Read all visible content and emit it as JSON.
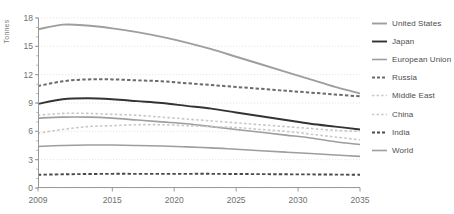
{
  "chart_data": {
    "type": "line",
    "title": "",
    "xlabel": "",
    "ylabel": "Tonnes",
    "xlim": [
      2009,
      2035
    ],
    "ylim": [
      0,
      18
    ],
    "grid": true,
    "legend_position": "right",
    "x_ticks": [
      "2009",
      "2015",
      "2020",
      "2025",
      "2030",
      "2035"
    ],
    "x_tick_values": [
      2009,
      2015,
      2020,
      2025,
      2030,
      2035
    ],
    "y_ticks": [
      "0",
      "3",
      "6",
      "9",
      "12",
      "15",
      "18"
    ],
    "y_tick_values": [
      0,
      3,
      6,
      9,
      12,
      15,
      18
    ],
    "x": [
      2009,
      2011,
      2013,
      2015,
      2017,
      2019,
      2021,
      2023,
      2025,
      2027,
      2029,
      2031,
      2033,
      2035
    ],
    "series": [
      {
        "name": "United States",
        "color": "#9e9e9e",
        "style": "solid",
        "width": 1.9,
        "values": [
          16.8,
          17.3,
          17.2,
          16.9,
          16.5,
          16.0,
          15.4,
          14.7,
          13.9,
          13.1,
          12.3,
          11.5,
          10.7,
          10.0
        ]
      },
      {
        "name": "Japan",
        "color": "#333333",
        "style": "solid",
        "width": 1.9,
        "values": [
          8.9,
          9.4,
          9.5,
          9.4,
          9.2,
          9.0,
          8.7,
          8.4,
          8.0,
          7.6,
          7.2,
          6.8,
          6.5,
          6.2
        ]
      },
      {
        "name": "European Union",
        "color": "#9e9e9e",
        "style": "solid",
        "width": 1.6,
        "values": [
          7.4,
          7.5,
          7.5,
          7.4,
          7.2,
          7.0,
          6.8,
          6.5,
          6.2,
          5.9,
          5.6,
          5.3,
          4.9,
          4.6
        ]
      },
      {
        "name": "Russia",
        "color": "#6b6b6b",
        "style": "dashed",
        "width": 2.0,
        "values": [
          10.8,
          11.3,
          11.5,
          11.5,
          11.4,
          11.3,
          11.1,
          10.9,
          10.7,
          10.5,
          10.3,
          10.1,
          9.9,
          9.7
        ]
      },
      {
        "name": "Middle East",
        "color": "#c8c8c8",
        "style": "dashed",
        "width": 1.6,
        "values": [
          7.7,
          7.9,
          7.9,
          7.8,
          7.7,
          7.5,
          7.3,
          7.1,
          6.9,
          6.7,
          6.5,
          6.3,
          6.1,
          6.0
        ]
      },
      {
        "name": "China",
        "color": "#c8c8c8",
        "style": "dashed",
        "width": 1.6,
        "values": [
          5.8,
          6.2,
          6.5,
          6.6,
          6.7,
          6.7,
          6.6,
          6.5,
          6.4,
          6.2,
          6.0,
          5.7,
          5.4,
          5.1
        ]
      },
      {
        "name": "India",
        "color": "#4a4a4a",
        "style": "dashed",
        "width": 1.9,
        "values": [
          1.4,
          1.45,
          1.48,
          1.5,
          1.5,
          1.5,
          1.5,
          1.5,
          1.48,
          1.47,
          1.45,
          1.44,
          1.42,
          1.4
        ]
      },
      {
        "name": "World",
        "color": "#9e9e9e",
        "style": "solid",
        "width": 1.6,
        "values": [
          4.4,
          4.5,
          4.55,
          4.55,
          4.5,
          4.45,
          4.35,
          4.25,
          4.1,
          3.95,
          3.8,
          3.65,
          3.5,
          3.35
        ]
      }
    ]
  },
  "axis": {
    "color": "#9a9a9a",
    "grid_color": "#dedede"
  }
}
